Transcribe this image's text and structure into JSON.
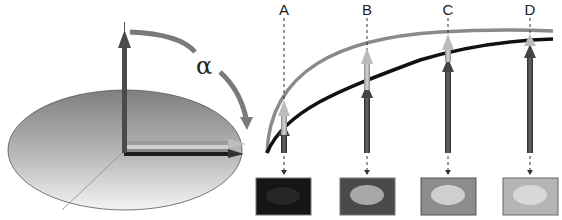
{
  "left_diagram": {
    "angle_symbol": "α",
    "description": "Disk with vertical axis arrow rotated by angle alpha toward horizontal"
  },
  "right_diagram": {
    "columns": [
      {
        "label": "A",
        "x": 285,
        "thumb_brightness": "#151515",
        "ellipse": "#262626"
      },
      {
        "label": "B",
        "x": 368,
        "thumb_brightness": "#4a4a4a",
        "ellipse": "#a8a8a8"
      },
      {
        "label": "C",
        "x": 448,
        "thumb_brightness": "#8c8c8c",
        "ellipse": "#cfcfcf"
      },
      {
        "label": "D",
        "x": 530,
        "thumb_brightness": "#b5b5b5",
        "ellipse": "#d8d8d8"
      }
    ],
    "curves": [
      {
        "name": "upper-curve",
        "color": "#8a8a8a"
      },
      {
        "name": "lower-curve",
        "color": "#111111"
      }
    ]
  },
  "colors": {
    "disk_top": "#8a8a8a",
    "disk_bottom": "#f2f2f2",
    "axis_arrow": "#4a4a4a",
    "alpha_arc": "#7a7a7a"
  }
}
